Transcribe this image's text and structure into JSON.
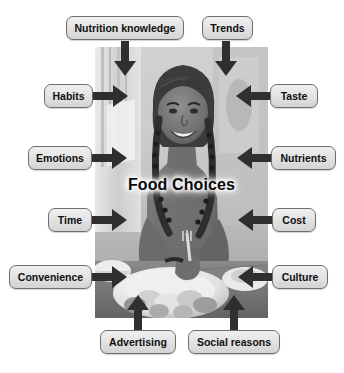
{
  "figure": {
    "center_label": "Food Choices",
    "photo_alt": "grayscale photo of a smiling young woman seated at a table with plates of food",
    "colors": {
      "box_border": "#6e6e6e",
      "box_fill_top": "#efefef",
      "box_fill_bottom": "#d3d3d3",
      "arrow": "#2f2f2f",
      "text": "#101010",
      "background": "#ffffff"
    }
  },
  "factors": [
    {
      "id": "nutrition-knowledge",
      "label": "Nutrition knowledge",
      "direction": "down",
      "box": {
        "x": 66,
        "y": 16,
        "w": 118
      }
    },
    {
      "id": "trends",
      "label": "Trends",
      "direction": "down",
      "box": {
        "x": 202,
        "y": 16,
        "w": 51
      }
    },
    {
      "id": "habits",
      "label": "Habits",
      "direction": "right",
      "box": {
        "x": 44,
        "y": 84,
        "w": 49
      }
    },
    {
      "id": "taste",
      "label": "Taste",
      "direction": "left",
      "box": {
        "x": 270,
        "y": 84,
        "w": 48
      }
    },
    {
      "id": "emotions",
      "label": "Emotions",
      "direction": "right",
      "box": {
        "x": 28,
        "y": 146,
        "w": 64
      }
    },
    {
      "id": "nutrients",
      "label": "Nutrients",
      "direction": "left",
      "box": {
        "x": 271,
        "y": 146,
        "w": 65
      }
    },
    {
      "id": "time",
      "label": "Time",
      "direction": "right",
      "box": {
        "x": 48,
        "y": 208,
        "w": 44
      }
    },
    {
      "id": "cost",
      "label": "Cost",
      "direction": "left",
      "box": {
        "x": 272,
        "y": 208,
        "w": 44
      }
    },
    {
      "id": "convenience",
      "label": "Convenience",
      "direction": "right",
      "box": {
        "x": 9,
        "y": 265,
        "w": 83
      }
    },
    {
      "id": "culture",
      "label": "Culture",
      "direction": "left",
      "box": {
        "x": 272,
        "y": 265,
        "w": 56
      }
    },
    {
      "id": "advertising",
      "label": "Advertising",
      "direction": "up",
      "box": {
        "x": 100,
        "y": 330,
        "w": 76
      }
    },
    {
      "id": "social-reasons",
      "label": "Social reasons",
      "direction": "up",
      "box": {
        "x": 188,
        "y": 330,
        "w": 92
      }
    }
  ],
  "arrows": [
    {
      "id": "arrow-nutrition-knowledge",
      "direction": "down",
      "x": 113,
      "y": 41,
      "w": 24,
      "h": 36
    },
    {
      "id": "arrow-trends",
      "direction": "down",
      "x": 214,
      "y": 41,
      "w": 24,
      "h": 36
    },
    {
      "id": "arrow-habits",
      "direction": "right",
      "x": 93,
      "y": 84,
      "w": 36,
      "h": 24
    },
    {
      "id": "arrow-taste",
      "direction": "left",
      "x": 235,
      "y": 84,
      "w": 36,
      "h": 24
    },
    {
      "id": "arrow-emotions",
      "direction": "right",
      "x": 92,
      "y": 146,
      "w": 36,
      "h": 24
    },
    {
      "id": "arrow-nutrients",
      "direction": "left",
      "x": 236,
      "y": 146,
      "w": 36,
      "h": 24
    },
    {
      "id": "arrow-time",
      "direction": "right",
      "x": 92,
      "y": 208,
      "w": 36,
      "h": 24
    },
    {
      "id": "arrow-cost",
      "direction": "left",
      "x": 237,
      "y": 208,
      "w": 36,
      "h": 24
    },
    {
      "id": "arrow-convenience",
      "direction": "right",
      "x": 92,
      "y": 265,
      "w": 36,
      "h": 24
    },
    {
      "id": "arrow-culture",
      "direction": "left",
      "x": 237,
      "y": 265,
      "w": 36,
      "h": 24
    },
    {
      "id": "arrow-advertising",
      "direction": "up",
      "x": 126,
      "y": 294,
      "w": 24,
      "h": 36
    },
    {
      "id": "arrow-social-reasons",
      "direction": "up",
      "x": 222,
      "y": 294,
      "w": 24,
      "h": 36
    }
  ]
}
